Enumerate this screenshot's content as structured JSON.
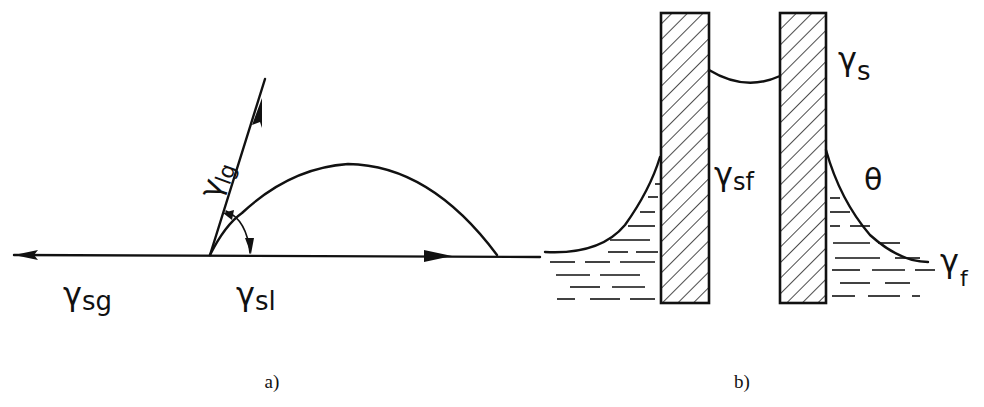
{
  "figure": {
    "panels": [
      {
        "id": "a",
        "caption": "a)",
        "description": "Sessile droplet on a solid surface with interfacial tension vectors",
        "labels": {
          "gamma_lg": "γlg",
          "gamma_sg": "γsg",
          "gamma_sl": "γsl"
        },
        "label_parts": {
          "lg": {
            "symbol": "γ",
            "sub": "lg"
          },
          "sg": {
            "symbol": "γ",
            "sub": "sg"
          },
          "sl": {
            "symbol": "γ",
            "sub": "sl"
          }
        }
      },
      {
        "id": "b",
        "caption": "b)",
        "description": "Two parallel hatched plates partially immersed in a liquid, with menisci",
        "labels": {
          "gamma_s": "γs",
          "gamma_sf": "γsf",
          "theta": "θ",
          "gamma_f": "γf"
        },
        "label_parts": {
          "s": {
            "symbol": "γ",
            "sub": "s"
          },
          "sf": {
            "symbol": "γ",
            "sub": "sf"
          },
          "theta": {
            "symbol": "θ"
          },
          "f": {
            "symbol": "γ",
            "sub": "f"
          }
        }
      }
    ],
    "colors": {
      "ink": "#111111",
      "background": "#ffffff"
    }
  }
}
